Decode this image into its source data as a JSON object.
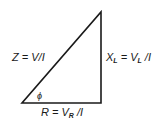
{
  "diagram": {
    "type": "impedance-triangle",
    "labels": {
      "hypotenuse": {
        "main": "Z = V/",
        "tail": "I"
      },
      "vertical": {
        "x": "X",
        "x_sub": "L",
        "eq": " = V",
        "v_sub": "L",
        "tail": " /I"
      },
      "base": {
        "r": "R = V",
        "r_sub": "R",
        "tail": " /I"
      },
      "angle": "ϕ"
    },
    "colors": {
      "line": "#1a1a1a",
      "background": "#ffffff"
    }
  }
}
